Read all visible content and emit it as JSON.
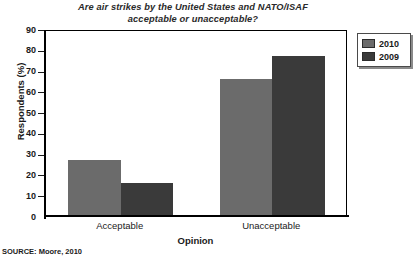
{
  "chart_data": {
    "type": "bar",
    "title": "Are air strikes by the United States and NATO/ISAF acceptable or unacceptable?",
    "title_line1": "Are air strikes by the United States and NATO/ISAF",
    "title_line2": "acceptable or unacceptable?",
    "xlabel": "Opinion",
    "ylabel": "Respondents (%)",
    "categories": [
      "Acceptable",
      "Unacceptable"
    ],
    "series": [
      {
        "name": "2010",
        "color": "#6b6b6b",
        "values": [
          27,
          66
        ]
      },
      {
        "name": "2009",
        "color": "#3a3a3a",
        "values": [
          16,
          77
        ]
      }
    ],
    "ylim": [
      0,
      90
    ],
    "ytick_labels": [
      "90",
      "80",
      "70",
      "60",
      "50",
      "40",
      "30",
      "20",
      "10",
      "0"
    ],
    "ytick_values": [
      90,
      80,
      70,
      60,
      50,
      40,
      30,
      20,
      10,
      0
    ],
    "grid": false,
    "legend_position": "right-top"
  },
  "legend": {
    "entries": [
      {
        "label": "2010",
        "color": "#6b6b6b"
      },
      {
        "label": "2009",
        "color": "#3a3a3a"
      }
    ]
  },
  "source": {
    "text": "SOURCE: Moore, 2010"
  }
}
